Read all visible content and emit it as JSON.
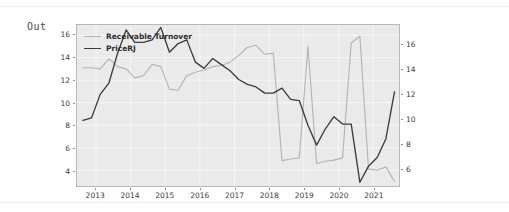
{
  "notebook": {
    "prompt_label": "Out"
  },
  "chart_data": {
    "type": "line",
    "title": "",
    "xlabel": "",
    "ylabel": "",
    "grid": true,
    "legend_position": "upper-left",
    "x_tick_labels": [
      "2013",
      "2014",
      "2015",
      "2016",
      "2017",
      "2018",
      "2019",
      "2020",
      "2021"
    ],
    "x_tick_values": [
      2013,
      2014,
      2015,
      2016,
      2017,
      2018,
      2019,
      2020,
      2021
    ],
    "xlim": [
      2012.45,
      2021.75
    ],
    "left_axis": {
      "series": "Receivable Turnover",
      "tick_labels": [
        "4",
        "6",
        "8",
        "10",
        "12",
        "14",
        "16"
      ],
      "tick_values": [
        4,
        6,
        8,
        10,
        12,
        14,
        16
      ],
      "ylim": [
        2.6,
        16.9
      ]
    },
    "right_axis": {
      "series": "PriceRJ",
      "tick_labels": [
        "6",
        "8",
        "10",
        "12",
        "14",
        "16"
      ],
      "tick_values": [
        6,
        8,
        10,
        12,
        14,
        16
      ],
      "ylim": [
        4.6,
        17.6
      ]
    },
    "series": [
      {
        "name": "Receivable Turnover",
        "axis": "left",
        "color": "#b5b5b5",
        "x": [
          2012.62,
          2012.87,
          2013.12,
          2013.37,
          2013.62,
          2013.87,
          2014.12,
          2014.37,
          2014.62,
          2014.87,
          2015.12,
          2015.37,
          2015.62,
          2015.87,
          2016.12,
          2016.37,
          2016.62,
          2016.87,
          2017.12,
          2017.37,
          2017.62,
          2017.87,
          2018.12,
          2018.37,
          2018.62,
          2018.87,
          2019.12,
          2019.37,
          2019.62,
          2019.87,
          2020.12,
          2020.37,
          2020.62,
          2020.87,
          2021.12,
          2021.37,
          2021.62
        ],
        "values": [
          13.1,
          13.1,
          13.0,
          13.9,
          13.2,
          13.0,
          12.2,
          12.4,
          13.4,
          13.2,
          11.2,
          11.1,
          12.4,
          12.7,
          12.9,
          13.2,
          13.3,
          13.6,
          14.2,
          14.9,
          15.1,
          14.3,
          14.4,
          4.85,
          5.0,
          5.1,
          15.0,
          4.6,
          4.8,
          4.9,
          5.1,
          15.3,
          15.9,
          4.1,
          4.0,
          4.3,
          3.0
        ]
      },
      {
        "name": "PriceRJ",
        "axis": "right",
        "color": "#3c3c3c",
        "x": [
          2012.62,
          2012.87,
          2013.12,
          2013.37,
          2013.62,
          2013.87,
          2014.12,
          2014.37,
          2014.62,
          2014.87,
          2015.12,
          2015.37,
          2015.62,
          2015.87,
          2016.12,
          2016.37,
          2016.62,
          2016.87,
          2017.12,
          2017.37,
          2017.62,
          2017.87,
          2018.12,
          2018.37,
          2018.62,
          2018.87,
          2019.12,
          2019.37,
          2019.62,
          2019.87,
          2020.12,
          2020.37,
          2020.62,
          2020.87,
          2021.12,
          2021.37,
          2021.62
        ],
        "values": [
          9.9,
          10.1,
          12.0,
          12.9,
          15.3,
          17.2,
          16.2,
          16.2,
          16.4,
          17.4,
          15.4,
          16.1,
          16.4,
          14.6,
          14.1,
          14.9,
          14.4,
          13.9,
          13.2,
          12.8,
          12.6,
          12.1,
          12.1,
          12.5,
          11.6,
          11.5,
          9.5,
          7.9,
          9.2,
          10.2,
          9.6,
          9.6,
          4.9,
          6.2,
          6.9,
          8.4,
          12.2
        ]
      }
    ]
  }
}
